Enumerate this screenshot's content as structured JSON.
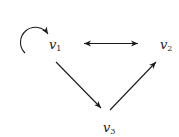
{
  "diagram": {
    "type": "directed-graph",
    "stroke_color": "#1a1a1a",
    "nodes": [
      {
        "id": "v1",
        "base": "v",
        "sub": "1",
        "x": 49,
        "y": 38
      },
      {
        "id": "v2",
        "base": "v",
        "sub": "2",
        "x": 160,
        "y": 38
      },
      {
        "id": "v3",
        "base": "v",
        "sub": "3",
        "x": 103,
        "y": 121
      }
    ],
    "edges": [
      {
        "from": "v1",
        "to": "v1",
        "kind": "self-loop"
      },
      {
        "from": "v1",
        "to": "v2",
        "kind": "bidirectional"
      },
      {
        "from": "v1",
        "to": "v3",
        "kind": "directed"
      },
      {
        "from": "v3",
        "to": "v2",
        "kind": "directed"
      }
    ]
  }
}
